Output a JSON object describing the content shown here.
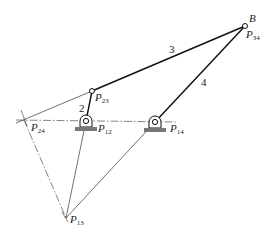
{
  "diagram": {
    "type": "mechanism-instant-centers",
    "colors": {
      "line": "#222222",
      "ground": "#777777",
      "background": "#ffffff"
    },
    "points": {
      "B": {
        "label": "B",
        "x": 245,
        "y": 26
      },
      "P34": {
        "label": "P",
        "sub": "34",
        "x": 245,
        "y": 26
      },
      "P23": {
        "label": "P",
        "sub": "23",
        "x": 92,
        "y": 91
      },
      "P12": {
        "label": "P",
        "sub": "12",
        "x": 86,
        "y": 121
      },
      "P14": {
        "label": "P",
        "sub": "14",
        "x": 155,
        "y": 122
      },
      "P24": {
        "label": "P",
        "sub": "24",
        "x": 24,
        "y": 120
      },
      "P13": {
        "label": "P",
        "sub": "13",
        "x": 66,
        "y": 218
      }
    },
    "links": [
      {
        "id": "2",
        "label": "2",
        "from": "P12",
        "to": "P23"
      },
      {
        "id": "3",
        "label": "3",
        "from": "P23",
        "to": "P34"
      },
      {
        "id": "4",
        "label": "4",
        "from": "P14",
        "to": "P34"
      }
    ],
    "construction_lines": [
      {
        "from": "P24",
        "to": "P23",
        "style": "solid-thin"
      },
      {
        "from": "P24",
        "to": "P14",
        "style": "dash-dot"
      },
      {
        "from": "P24",
        "to": "P13",
        "style": "dash-dot"
      },
      {
        "from": "P12",
        "to": "P13",
        "style": "solid-thin"
      },
      {
        "from": "P14",
        "to": "P13",
        "style": "solid-thin"
      }
    ]
  },
  "labels": {
    "B": "B",
    "P": "P",
    "s34": "34",
    "s23": "23",
    "s12": "12",
    "s14": "14",
    "s24": "24",
    "s13": "13",
    "link2": "2",
    "link3": "3",
    "link4": "4"
  }
}
